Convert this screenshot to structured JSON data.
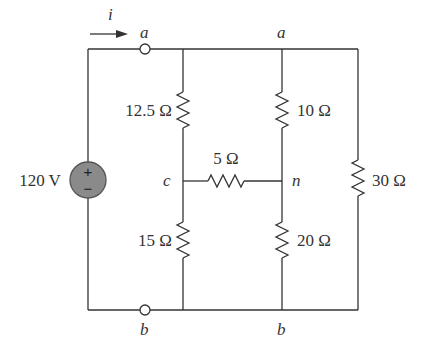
{
  "diagram": {
    "type": "circuit",
    "current_label": "i",
    "source": {
      "label": "120 V",
      "plus": "+",
      "minus": "−",
      "fill": "#8a8a8a"
    },
    "nodes": {
      "a_terminal": "a",
      "a_top": "a",
      "b_terminal": "b",
      "b_bottom": "b",
      "c": "c",
      "n": "n"
    },
    "resistors": {
      "r_12_5": "12.5 Ω",
      "r_10": "10 Ω",
      "r_5": "5 Ω",
      "r_30": "30 Ω",
      "r_15": "15 Ω",
      "r_20": "20 Ω"
    },
    "colors": {
      "wire": "#333333",
      "text": "#333333",
      "source_fill": "#8a8a8a"
    }
  }
}
